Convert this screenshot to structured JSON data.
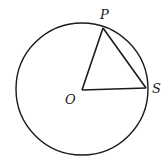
{
  "diagram": {
    "type": "circle-geometry",
    "stroke_color": "#1a1a1a",
    "background": "#ffffff",
    "circle": {
      "cx": 82,
      "cy": 89,
      "r": 66
    },
    "points": {
      "O": {
        "label": "O",
        "x": 82,
        "y": 90
      },
      "P": {
        "label": "P",
        "x": 103,
        "y": 28
      },
      "S": {
        "label": "S",
        "x": 146,
        "y": 88
      }
    },
    "segments": [
      {
        "from": "O",
        "to": "P"
      },
      {
        "from": "O",
        "to": "S"
      },
      {
        "from": "P",
        "to": "S"
      }
    ],
    "labels": {
      "P": "P",
      "O": "O",
      "S": "S"
    }
  }
}
